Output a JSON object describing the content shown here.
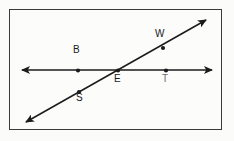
{
  "figure": {
    "background_color": "#fbfbfa",
    "frame_color": "#3a3a3c",
    "stroke_color": "#1b1b1d",
    "point_color": "#1b1b1d",
    "lines": [
      {
        "name": "horizontal-line",
        "label": "BET",
        "x1": 22,
        "y1": 70,
        "x2": 212,
        "y2": 70,
        "double_arrow": true
      },
      {
        "name": "diagonal-line",
        "label": "SEW",
        "x1": 26,
        "y1": 122,
        "x2": 206,
        "y2": 20,
        "double_arrow": true
      }
    ],
    "points": [
      {
        "name": "point-b",
        "label": "B",
        "x": 78,
        "y": 70.5,
        "label_x": 73,
        "label_y": 52,
        "on_line": "horizontal-line",
        "faint": false
      },
      {
        "name": "point-e",
        "label": "E",
        "x": 118,
        "y": 70.5,
        "label_x": 114,
        "label_y": 75,
        "on_line": "intersection",
        "faint": false
      },
      {
        "name": "point-t",
        "label": "T",
        "x": 166,
        "y": 70.5,
        "label_x": 162,
        "label_y": 75,
        "on_line": "horizontal-line",
        "faint": true
      },
      {
        "name": "point-w",
        "label": "W",
        "x": 163,
        "y": 48,
        "label_x": 155,
        "label_y": 32,
        "on_line": "diagonal-line",
        "faint": false
      },
      {
        "name": "point-s",
        "label": "S",
        "x": 79,
        "y": 92,
        "label_x": 76,
        "label_y": 95,
        "on_line": "diagonal-line",
        "faint": false
      }
    ]
  }
}
